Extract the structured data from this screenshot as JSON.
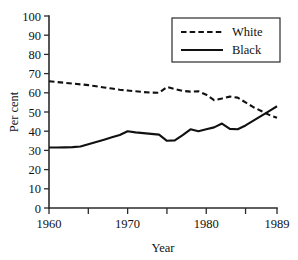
{
  "chart_data": {
    "type": "line",
    "title": "",
    "xlabel": "Year",
    "ylabel": "Per cent",
    "xlim": [
      1960,
      1989
    ],
    "ylim": [
      0,
      100
    ],
    "grid": false,
    "legend_position": "top-right",
    "y_ticks": [
      0,
      10,
      20,
      30,
      40,
      50,
      60,
      70,
      80,
      90,
      100
    ],
    "y_tick_labels": [
      "0",
      "10",
      "20",
      "30",
      "40",
      "50",
      "60",
      "70",
      "80",
      "90",
      "100"
    ],
    "x_ticks": [
      1960,
      1965,
      1970,
      1975,
      1980,
      1985,
      1989
    ],
    "x_tick_labels": [
      "1960",
      "",
      "1970",
      "",
      "1980",
      "",
      "1989"
    ],
    "x": [
      1960,
      1961,
      1962,
      1963,
      1964,
      1965,
      1966,
      1967,
      1968,
      1969,
      1970,
      1971,
      1972,
      1973,
      1974,
      1975,
      1976,
      1977,
      1978,
      1979,
      1980,
      1981,
      1982,
      1983,
      1984,
      1985,
      1986,
      1987,
      1988,
      1989
    ],
    "series": [
      {
        "name": "White",
        "style": "dashed",
        "color": "#111111",
        "values": [
          66,
          65.6,
          65.2,
          64.8,
          64.4,
          64,
          63.4,
          62.8,
          62.2,
          61.6,
          61.2,
          60.8,
          60.4,
          60.1,
          60,
          63,
          62,
          61,
          60.6,
          60.8,
          59,
          56.2,
          57,
          58,
          57.5,
          55,
          52.5,
          50.5,
          48.5,
          47
        ]
      },
      {
        "name": "Black",
        "style": "solid",
        "color": "#111111",
        "values": [
          31.5,
          31.5,
          31.6,
          31.7,
          32,
          33.2,
          34.4,
          35.6,
          36.8,
          38,
          40,
          39.4,
          39,
          38.6,
          38.2,
          35,
          35.2,
          38,
          41,
          40,
          41,
          42,
          44,
          41.2,
          41,
          43,
          45.5,
          48,
          50.5,
          53
        ]
      }
    ],
    "legend": [
      {
        "label": "White",
        "style": "dashed"
      },
      {
        "label": "Black",
        "style": "solid"
      }
    ]
  },
  "axes": {
    "y_label": "Per cent",
    "x_label": "Year"
  }
}
